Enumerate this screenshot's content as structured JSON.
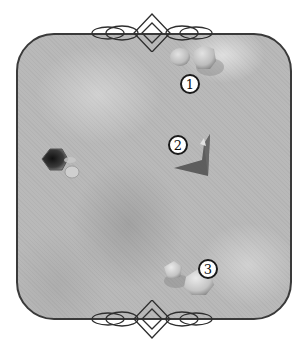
{
  "diagram": {
    "type": "board-map",
    "board": {
      "shape": "rounded-square",
      "fill": "#b9b9b9",
      "border": "#3a3a3a"
    },
    "ornaments": [
      {
        "position": "top",
        "style": "diamond-with-loops"
      },
      {
        "position": "bottom",
        "style": "diamond-with-loops"
      }
    ],
    "markers": [
      {
        "id": 1,
        "label": "1",
        "near": "twin-rocks-top"
      },
      {
        "id": 2,
        "label": "2",
        "near": "angled-wall-center"
      },
      {
        "id": 3,
        "label": "3",
        "near": "twin-rocks-bottom"
      }
    ],
    "objects": [
      {
        "name": "rocks-top",
        "description": "two pale boulders near top edge"
      },
      {
        "name": "wedge-structure",
        "description": "dark angled wedge/ramp in center-right"
      },
      {
        "name": "hexagonal-pit",
        "description": "dark hexagonal hole with small stone on left side"
      },
      {
        "name": "rocks-bottom",
        "description": "two pale boulders near bottom edge"
      }
    ]
  }
}
